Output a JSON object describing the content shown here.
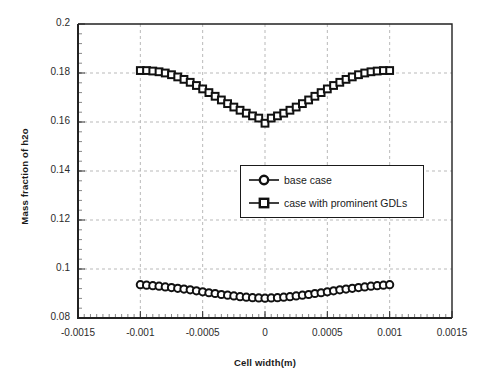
{
  "chart_data": {
    "type": "scatter",
    "title": "",
    "subtitle": "",
    "xlabel": "Cell width(m)",
    "ylabel": "Mass fraction of h2o",
    "xlim": [
      -0.0015,
      0.0015
    ],
    "ylim": [
      0.08,
      0.2
    ],
    "xticks": [
      -0.0015,
      -0.001,
      -0.0005,
      0,
      0.0005,
      0.001,
      0.0015
    ],
    "yticks": [
      0.08,
      0.1,
      0.12,
      0.14,
      0.16,
      0.18,
      0.2
    ],
    "xtick_labels": [
      "-0.0015",
      "-0.001",
      "-0.0005",
      "0",
      "0.0005",
      "0.001",
      "0.0015"
    ],
    "ytick_labels": [
      "0.08",
      "0.1",
      "0.12",
      "0.14",
      "0.16",
      "0.18",
      "0.2"
    ],
    "grid": true,
    "grid_style": "dashed",
    "grid_color": "#b9b9b9",
    "legend_position": "center-right-inside",
    "marker_edge_color": "#111111",
    "marker_face_color": "#ffffff",
    "line_color": "#111111",
    "series": [
      {
        "name": "base case",
        "marker": "circle",
        "x": [
          -0.001,
          -0.00095,
          -0.0009,
          -0.00085,
          -0.0008,
          -0.00075,
          -0.0007,
          -0.00065,
          -0.0006,
          -0.00055,
          -0.0005,
          -0.00045,
          -0.0004,
          -0.00035,
          -0.0003,
          -0.00025,
          -0.0002,
          -0.00015,
          -0.0001,
          -5e-05,
          0,
          5e-05,
          0.0001,
          0.00015,
          0.0002,
          0.00025,
          0.0003,
          0.00035,
          0.0004,
          0.00045,
          0.0005,
          0.00055,
          0.0006,
          0.00065,
          0.0007,
          0.00075,
          0.0008,
          0.00085,
          0.0009,
          0.00095,
          0.001
        ],
        "values": [
          0.0936,
          0.0934,
          0.0932,
          0.093,
          0.0927,
          0.0924,
          0.0921,
          0.0918,
          0.0915,
          0.0911,
          0.0907,
          0.0903,
          0.09,
          0.0896,
          0.0893,
          0.089,
          0.0887,
          0.0885,
          0.0883,
          0.0882,
          0.0881,
          0.0882,
          0.0883,
          0.0885,
          0.0887,
          0.089,
          0.0893,
          0.0896,
          0.09,
          0.0903,
          0.0907,
          0.0911,
          0.0915,
          0.0918,
          0.0921,
          0.0924,
          0.0927,
          0.093,
          0.0932,
          0.0934,
          0.0936
        ]
      },
      {
        "name": "case with prominent GDLs",
        "marker": "square",
        "x": [
          -0.001,
          -0.00095,
          -0.0009,
          -0.00085,
          -0.0008,
          -0.00075,
          -0.0007,
          -0.00065,
          -0.0006,
          -0.00055,
          -0.0005,
          -0.00045,
          -0.0004,
          -0.00035,
          -0.0003,
          -0.00025,
          -0.0002,
          -0.00015,
          -0.0001,
          -5e-05,
          0,
          5e-05,
          0.0001,
          0.00015,
          0.0002,
          0.00025,
          0.0003,
          0.00035,
          0.0004,
          0.00045,
          0.0005,
          0.00055,
          0.0006,
          0.00065,
          0.0007,
          0.00075,
          0.0008,
          0.00085,
          0.0009,
          0.00095,
          0.001
        ],
        "values": [
          0.181,
          0.181,
          0.1808,
          0.1805,
          0.18,
          0.1793,
          0.1784,
          0.1774,
          0.1762,
          0.1749,
          0.1735,
          0.172,
          0.1705,
          0.169,
          0.1675,
          0.1661,
          0.1648,
          0.1636,
          0.1625,
          0.1616,
          0.1595,
          0.1616,
          0.1625,
          0.1636,
          0.1648,
          0.1661,
          0.1675,
          0.169,
          0.1705,
          0.172,
          0.1735,
          0.1749,
          0.1762,
          0.1774,
          0.1784,
          0.1793,
          0.18,
          0.1805,
          0.1808,
          0.181,
          0.181
        ]
      }
    ]
  },
  "legend": {
    "entries": [
      {
        "label": "base case",
        "marker": "circle"
      },
      {
        "label": "case with prominent GDLs",
        "marker": "square"
      }
    ]
  }
}
